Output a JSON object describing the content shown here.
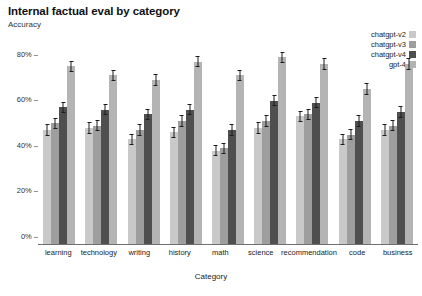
{
  "chart_data": {
    "type": "bar",
    "title": "Internal factual eval by category",
    "subtitle": "Accuracy",
    "xlabel": "Category",
    "ylabel": "Accuracy",
    "ylim": [
      0,
      0.9
    ],
    "ytick_labels": [
      "0%",
      "20%",
      "40%",
      "60%",
      "80%"
    ],
    "ytick_values": [
      0,
      20,
      40,
      60,
      80
    ],
    "grid": false,
    "legend_position": "top-right",
    "categories": [
      "learning",
      "technology",
      "writing",
      "history",
      "math",
      "science",
      "recommendation",
      "code",
      "business"
    ],
    "series": [
      {
        "name": "chatgpt-v2",
        "color": "#c9c9c9",
        "values": [
          50,
          51,
          46,
          49,
          41,
          51,
          56,
          46,
          50
        ],
        "errors": [
          2.5,
          2.5,
          2.5,
          2.5,
          2.5,
          2.5,
          2.5,
          2.5,
          2.5
        ]
      },
      {
        "name": "chatgpt-v3",
        "color": "#9e9e9e",
        "values": [
          53,
          52,
          50,
          54,
          42,
          54,
          57,
          48,
          52
        ],
        "errors": [
          2.5,
          2.5,
          2.5,
          2.5,
          2.5,
          2.5,
          2.5,
          2.5,
          2.5
        ]
      },
      {
        "name": "chatgpt-v4",
        "color": "#4f4f4f",
        "values": [
          60,
          59,
          57,
          59,
          50,
          63,
          62,
          54,
          58
        ],
        "errors": [
          2.5,
          2.5,
          2.5,
          2.5,
          2.5,
          2.5,
          2.5,
          2.5,
          2.5
        ]
      },
      {
        "name": "gpt-4",
        "color": "#b4b4b4",
        "values": [
          78,
          74,
          72,
          80,
          74,
          82,
          79,
          68,
          79
        ],
        "errors": [
          2.5,
          2.5,
          2.5,
          2.5,
          2.5,
          2.5,
          2.5,
          2.5,
          2.5
        ]
      }
    ]
  },
  "tick_dash": "–"
}
